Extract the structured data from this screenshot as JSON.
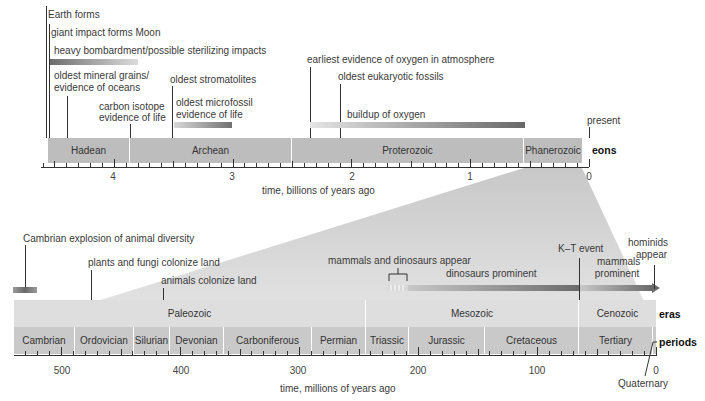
{
  "chart_data": {
    "type": "timeline",
    "top_timeline": {
      "xlabel": "time, billions of years ago",
      "row_label": "eons",
      "range": [
        4.6,
        0
      ],
      "ticks": [
        "4",
        "3",
        "2",
        "1",
        "0"
      ],
      "eons": [
        {
          "name": "Hadean",
          "start": 4.6,
          "end": 4.0
        },
        {
          "name": "Archean",
          "start": 4.0,
          "end": 2.5
        },
        {
          "name": "Proterozoic",
          "start": 2.5,
          "end": 0.541
        },
        {
          "name": "Phanerozoic",
          "start": 0.541,
          "end": 0
        }
      ],
      "events": [
        {
          "label": "Earth forms",
          "time": 4.6
        },
        {
          "label": "giant impact forms Moon",
          "time": 4.55
        },
        {
          "label": "heavy bombardment/possible sterilizing impacts",
          "start": 4.55,
          "end": 3.8
        },
        {
          "label": "oldest mineral grains/ evidence of oceans",
          "time": 4.4
        },
        {
          "label": "carbon isotope evidence of life",
          "time": 3.85
        },
        {
          "label": "oldest stromatolites",
          "time": 3.5
        },
        {
          "label": "oldest microfossil evidence of life",
          "start": 3.5,
          "end": 3.0
        },
        {
          "label": "earliest evidence of oxygen in atmosphere",
          "time": 2.35
        },
        {
          "label": "oldest eukaryotic fossils",
          "time": 2.1
        },
        {
          "label": "buildup of oxygen",
          "start": 2.35,
          "end": 0.55
        },
        {
          "label": "present",
          "time": 0
        }
      ]
    },
    "bottom_timeline": {
      "xlabel": "time, millions of years ago",
      "range": [
        541,
        0
      ],
      "ticks": [
        "500",
        "400",
        "300",
        "200",
        "100",
        "0"
      ],
      "eras": [
        {
          "name": "Paleozoic",
          "start": 541,
          "end": 252
        },
        {
          "name": "Mesozoic",
          "start": 252,
          "end": 66
        },
        {
          "name": "Cenozoic",
          "start": 66,
          "end": 0
        }
      ],
      "periods": [
        {
          "name": "Cambrian",
          "start": 541,
          "end": 485
        },
        {
          "name": "Ordovician",
          "start": 485,
          "end": 443
        },
        {
          "name": "Silurian",
          "start": 443,
          "end": 419
        },
        {
          "name": "Devonian",
          "start": 419,
          "end": 359
        },
        {
          "name": "Carboniferous",
          "start": 359,
          "end": 299
        },
        {
          "name": "Permian",
          "start": 299,
          "end": 252
        },
        {
          "name": "Triassic",
          "start": 252,
          "end": 201
        },
        {
          "name": "Jurassic",
          "start": 201,
          "end": 145
        },
        {
          "name": "Cretaceous",
          "start": 145,
          "end": 66
        },
        {
          "name": "Tertiary",
          "start": 66,
          "end": 2.6
        },
        {
          "name": "Quaternary",
          "start": 2.6,
          "end": 0
        }
      ],
      "events": [
        {
          "label": "Cambrian explosion of animal diversity",
          "time": 530
        },
        {
          "label": "plants and fungi colonize land",
          "time": 475
        },
        {
          "label": "animals colonize land",
          "time": 420
        },
        {
          "label": "mammals and dinosaurs appear",
          "start": 225,
          "end": 205
        },
        {
          "label": "dinosaurs prominent",
          "start": 205,
          "end": 66
        },
        {
          "label": "K–T event",
          "time": 66
        },
        {
          "label": "mammals prominent",
          "start": 66,
          "end": 0
        },
        {
          "label": "hominids appear",
          "time": 6
        }
      ]
    }
  },
  "top": {
    "eons_label": "eons",
    "axis_title": "time, billions of years ago",
    "ticks": [
      "4",
      "3",
      "2",
      "1",
      "0"
    ],
    "eons": [
      "Hadean",
      "Archean",
      "Proterozoic",
      "Phanerozoic"
    ],
    "events": {
      "earth_forms": "Earth forms",
      "moon": "giant impact forms Moon",
      "bombardment": "heavy bombardment/possible sterilizing impacts",
      "mineral1": "oldest mineral grains/",
      "mineral2": "evidence of oceans",
      "carbon1": "carbon isotope",
      "carbon2": "evidence of life",
      "stromatolites": "oldest stromatolites",
      "microfossil1": "oldest microfossil",
      "microfossil2": "evidence of life",
      "oxygen_earliest": "earliest evidence of oxygen in atmosphere",
      "eukaryotic": "oldest eukaryotic fossils",
      "oxygen_buildup": "buildup of oxygen",
      "present": "present"
    }
  },
  "bottom": {
    "eras_label": "eras",
    "periods_label": "periods",
    "axis_title": "time, millions of years ago",
    "ticks": [
      "500",
      "400",
      "300",
      "200",
      "100",
      "0"
    ],
    "eras": [
      "Paleozoic",
      "Mesozoic",
      "Cenozoic"
    ],
    "periods": [
      "Cambrian",
      "Ordovician",
      "Silurian",
      "Devonian",
      "Carboniferous",
      "Permian",
      "Triassic",
      "Jurassic",
      "Cretaceous",
      "Tertiary"
    ],
    "quaternary": "Quaternary",
    "events": {
      "cambrian": "Cambrian explosion of animal diversity",
      "plants": "plants and fungi colonize land",
      "animals": "animals colonize land",
      "mammals_dinos": "mammals and dinosaurs appear",
      "dinos_prominent": "dinosaurs prominent",
      "kt": "K–T event",
      "mammals1": "mammals",
      "mammals2": "prominent",
      "hominids1": "hominids",
      "hominids2": "appear"
    }
  }
}
